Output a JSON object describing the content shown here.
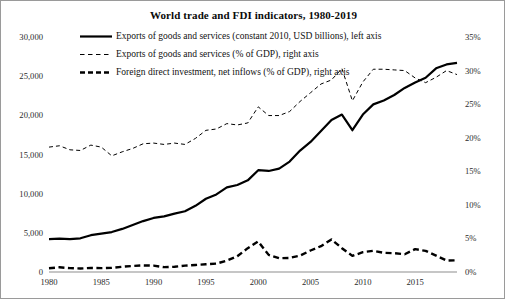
{
  "chart_data": {
    "type": "line",
    "title": "World trade and FDI indicators, 1980-2019",
    "xlabel": "",
    "ylabel": "",
    "grid": false,
    "legend_position": "top-center-inside",
    "x": [
      1980,
      1981,
      1982,
      1983,
      1984,
      1985,
      1986,
      1987,
      1988,
      1989,
      1990,
      1991,
      1992,
      1993,
      1994,
      1995,
      1996,
      1997,
      1998,
      1999,
      2000,
      2001,
      2002,
      2003,
      2004,
      2005,
      2006,
      2007,
      2008,
      2009,
      2010,
      2011,
      2012,
      2013,
      2014,
      2015,
      2016,
      2017,
      2018,
      2019
    ],
    "xlim": [
      1980,
      2019
    ],
    "xticks": [
      1980,
      1985,
      1990,
      1995,
      2000,
      2005,
      2010,
      2015
    ],
    "xticklabels": [
      "1980",
      "1985",
      "1990",
      "1995",
      "2000",
      "2005",
      "2010",
      "2015"
    ],
    "left_axis": {
      "label": "",
      "ylim": [
        0,
        30000
      ],
      "yticks": [
        0,
        5000,
        10000,
        15000,
        20000,
        25000,
        30000
      ],
      "yticklabels": [
        "0",
        "5,000",
        "10,000",
        "15,000",
        "20,000",
        "25,000",
        "30,000"
      ],
      "units": "constant 2010, USD billions"
    },
    "right_axis": {
      "label": "",
      "ylim": [
        0,
        35
      ],
      "yticks": [
        0,
        5,
        10,
        15,
        20,
        25,
        30,
        35
      ],
      "yticklabels": [
        "0%",
        "5%",
        "10%",
        "15%",
        "20%",
        "25%",
        "30%",
        "35%"
      ],
      "units": "percent of GDP"
    },
    "series": [
      {
        "name": "Exports of goods and services (constant 2010, USD billions), left axis",
        "axis": "left",
        "style": "solid",
        "color": "#000000",
        "width": 2.2,
        "values": [
          4200,
          4250,
          4200,
          4300,
          4700,
          4900,
          5100,
          5500,
          6000,
          6500,
          6900,
          7100,
          7450,
          7750,
          8450,
          9350,
          9900,
          10800,
          11100,
          11700,
          13000,
          12900,
          13200,
          14100,
          15500,
          16600,
          18000,
          19400,
          20100,
          18100,
          20100,
          21400,
          21900,
          22600,
          23500,
          24200,
          24800,
          26000,
          26500,
          26700
        ]
      },
      {
        "name": "Exports of goods and services (% of GDP), right axis",
        "axis": "right",
        "style": "dashed-thin",
        "color": "#000000",
        "width": 1.0,
        "values": [
          18.6,
          18.8,
          18.2,
          18.1,
          18.9,
          18.6,
          17.3,
          17.9,
          18.4,
          19.1,
          19.2,
          19.0,
          19.2,
          19.0,
          19.9,
          21.1,
          21.3,
          22.1,
          21.9,
          22.2,
          24.6,
          23.3,
          23.3,
          23.9,
          25.4,
          26.7,
          28.0,
          28.6,
          30.3,
          25.5,
          28.3,
          30.2,
          30.2,
          30.1,
          30.0,
          28.9,
          28.2,
          29.0,
          30.0,
          29.4
        ]
      },
      {
        "name": "Foreign direct investment, net inflows (% of GDP), right axis",
        "axis": "right",
        "style": "dashed-thick",
        "color": "#000000",
        "width": 2.4,
        "values": [
          0.55,
          0.7,
          0.58,
          0.52,
          0.6,
          0.58,
          0.62,
          0.78,
          0.9,
          0.98,
          0.95,
          0.72,
          0.78,
          0.95,
          1.05,
          1.15,
          1.25,
          1.7,
          2.35,
          3.55,
          4.55,
          2.55,
          2.05,
          2.1,
          2.45,
          3.2,
          3.85,
          4.85,
          3.55,
          2.4,
          2.95,
          3.15,
          2.85,
          2.8,
          2.65,
          3.4,
          3.15,
          2.45,
          1.7,
          1.75
        ]
      }
    ],
    "legend": [
      {
        "marker": "solid",
        "label": "Exports of goods and services (constant 2010, USD billions), left axis"
      },
      {
        "marker": "dashed-thin",
        "label": "Exports of goods and services (% of GDP), right axis"
      },
      {
        "marker": "dashed-thick",
        "label": "Foreign direct investment, net inflows (% of GDP), right axis"
      }
    ]
  }
}
